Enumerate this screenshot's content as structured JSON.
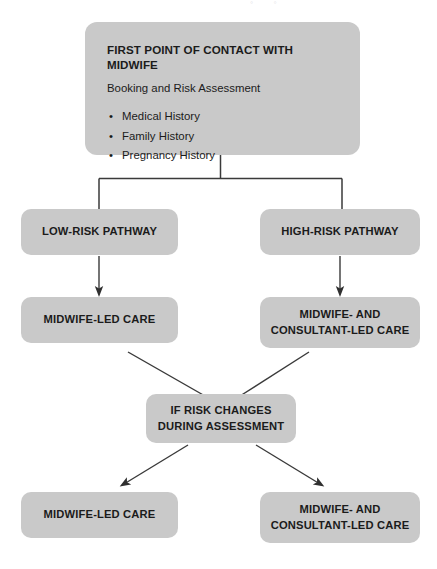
{
  "diagram": {
    "box_fill_color": "#c9c9c9",
    "connector_color": "#3a3a3a",
    "text_color": "#1b1b1b",
    "artifact_text": "° °"
  },
  "nodes": {
    "intake": {
      "heading": "FIRST POINT OF CONTACT WITH MIDWIFE",
      "subheading": "Booking and Risk Assessment",
      "bullets": [
        "Medical History",
        "Family History",
        "Pregnancy History"
      ]
    },
    "low_risk_pathway": {
      "label": "LOW-RISK PATHWAY"
    },
    "high_risk_pathway": {
      "label": "HIGH-RISK PATHWAY"
    },
    "care_low": {
      "label": "MIDWIFE-LED CARE"
    },
    "care_high": {
      "line1": "MIDWIFE- AND",
      "line2": "CONSULTANT-LED CARE"
    },
    "risk_change": {
      "line1": "IF RISK CHANGES",
      "line2": "DURING ASSESSMENT"
    },
    "care_low_2": {
      "label": "MIDWIFE-LED CARE"
    },
    "care_high_2": {
      "line1": "MIDWIFE- AND",
      "line2": "CONSULTANT-LED CARE"
    }
  }
}
